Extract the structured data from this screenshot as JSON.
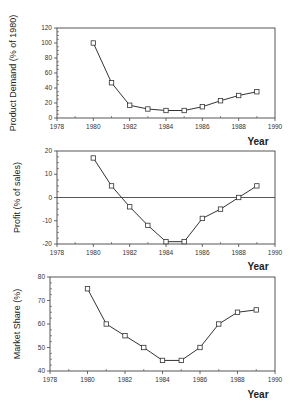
{
  "chart_data": [
    {
      "type": "line",
      "title": "",
      "xlabel": "Year",
      "ylabel": "Product Demand (% of 1980)",
      "x": [
        1980,
        1981,
        1982,
        1983,
        1984,
        1985,
        1986,
        1987,
        1988,
        1989
      ],
      "series": [
        {
          "name": "Product Demand",
          "values": [
            100,
            47,
            17,
            12,
            10,
            10,
            15,
            23,
            30,
            35
          ]
        }
      ],
      "xlim": [
        1978,
        1990
      ],
      "ylim": [
        0,
        120
      ],
      "xticks": [
        1978,
        1980,
        1982,
        1984,
        1986,
        1988,
        1990
      ],
      "yticks": [
        0,
        20,
        40,
        60,
        80,
        100,
        120
      ],
      "grid": false,
      "marker": "open-square",
      "zero_line": false
    },
    {
      "type": "line",
      "title": "",
      "xlabel": "Year",
      "ylabel": "Profit (% of sales)",
      "x": [
        1980,
        1981,
        1982,
        1983,
        1984,
        1985,
        1986,
        1987,
        1988,
        1989
      ],
      "series": [
        {
          "name": "Profit",
          "values": [
            17,
            5,
            -4,
            -12,
            -19,
            -19,
            -9,
            -5,
            0,
            5
          ]
        }
      ],
      "xlim": [
        1978,
        1990
      ],
      "ylim": [
        -20,
        20
      ],
      "xticks": [
        1978,
        1980,
        1982,
        1984,
        1986,
        1988,
        1990
      ],
      "yticks": [
        -20,
        -10,
        0,
        10,
        20
      ],
      "grid": false,
      "marker": "open-square",
      "zero_line": true
    },
    {
      "type": "line",
      "title": "",
      "xlabel": "Year",
      "ylabel": "Market Share (%)",
      "x": [
        1980,
        1981,
        1982,
        1983,
        1984,
        1985,
        1986,
        1987,
        1988,
        1989
      ],
      "series": [
        {
          "name": "Market Share",
          "values": [
            75,
            60,
            55,
            50,
            44.5,
            44.5,
            50,
            60,
            65,
            66
          ]
        }
      ],
      "xlim": [
        1978,
        1990
      ],
      "ylim": [
        40,
        80
      ],
      "xticks": [
        1978,
        1980,
        1982,
        1984,
        1986,
        1988,
        1990
      ],
      "yticks": [
        40,
        50,
        60,
        70,
        80
      ],
      "grid": false,
      "marker": "open-square",
      "zero_line": false
    }
  ],
  "layout": {
    "panels": [
      {
        "left": 57,
        "right": 275,
        "top": 28,
        "bottom": 118,
        "ylabel_x": 16,
        "year_x": 258,
        "year_y": 145
      },
      {
        "left": 57,
        "right": 275,
        "top": 151,
        "bottom": 244,
        "ylabel_x": 20,
        "year_x": 258,
        "year_y": 270
      },
      {
        "left": 50,
        "right": 275,
        "top": 277,
        "bottom": 371,
        "ylabel_x": 20,
        "year_x": 258,
        "year_y": 398
      }
    ],
    "colors": {
      "line": "#333333",
      "axis": "#444444",
      "marker_fill": "#ffffff"
    }
  }
}
